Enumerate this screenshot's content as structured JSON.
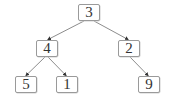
{
  "diagram": {
    "type": "binary-tree",
    "colors": {
      "edge": "#6e6e6e",
      "node_border": "#9a9a9a",
      "node_text": "#333333",
      "background": "#ffffff"
    },
    "nodes": [
      {
        "id": "n3",
        "label": "3",
        "x": 78,
        "y": 4
      },
      {
        "id": "n4",
        "label": "4",
        "x": 36,
        "y": 40
      },
      {
        "id": "n2",
        "label": "2",
        "x": 118,
        "y": 40
      },
      {
        "id": "n5",
        "label": "5",
        "x": 15,
        "y": 76
      },
      {
        "id": "n1",
        "label": "1",
        "x": 56,
        "y": 76
      },
      {
        "id": "n9",
        "label": "9",
        "x": 138,
        "y": 76
      }
    ],
    "edges": [
      {
        "from": "3",
        "to": "4"
      },
      {
        "from": "3",
        "to": "2"
      },
      {
        "from": "4",
        "to": "5"
      },
      {
        "from": "4",
        "to": "1"
      },
      {
        "from": "2",
        "to": "9"
      }
    ]
  }
}
